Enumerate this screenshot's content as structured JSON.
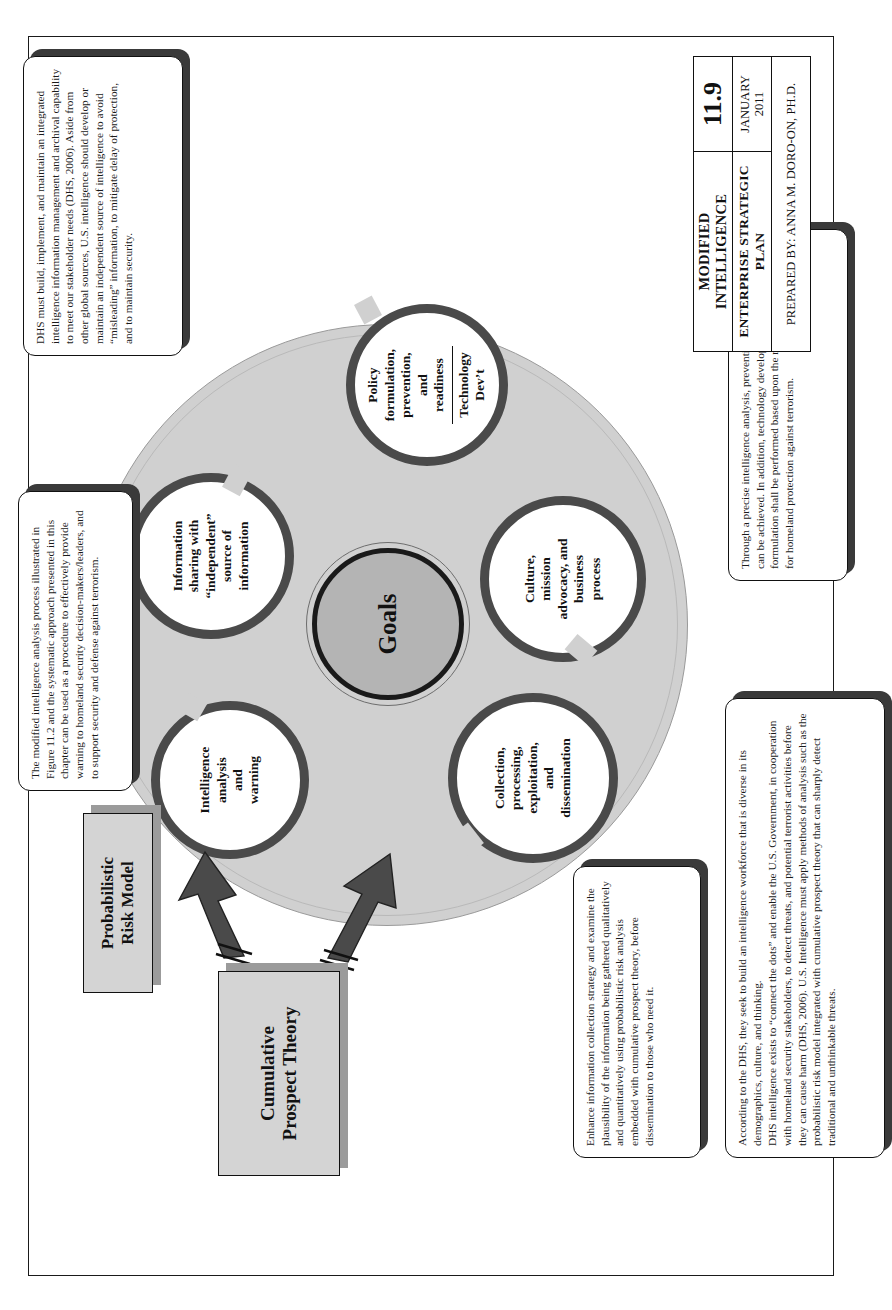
{
  "figure": {
    "labels": {
      "cumulative_prospect_theory": "Cumulative\nProspect Theory",
      "probabilistic_risk_model": "Probabilistic\nRisk Model",
      "center": "Goals"
    },
    "nodes": [
      {
        "id": "intelligence-analysis-and-warning",
        "label": "Intelligence\nanalysis\nand\nwarning"
      },
      {
        "id": "information-sharing",
        "label": "Information\nsharing with\n“independent”\nsource of\ninformation"
      },
      {
        "id": "policy-formulation",
        "label": "Policy\nformulation,\nprevention,\nand\nreadiness",
        "sub": "Technology\nDev’t"
      },
      {
        "id": "culture-mission-advocacy",
        "label": "Culture,\nmission\nadvocacy, and\nbusiness\nprocess"
      },
      {
        "id": "collection-processing",
        "label": "Collection,\nprocessing,\nexploitation,\nand\ndissemination"
      }
    ]
  },
  "callouts": {
    "top_left": "The modified intelligence analysis process illustrated in Figure 11.2 and the systematic approach presented in this chapter can be used as a procedure to effectively provide warning to homeland security decision-makers/leaders, and to support security and defense against terrorism.",
    "top_right": "DHS must build, implement, and maintain an integrated intelligence information management and archival capability to meet our stakeholder needs (DHS, 2006). Aside from other global sources, U.S. intelligence should develop or maintain an independent source of intelligence to avoid “misleading” information, to mitigate delay of protection, and to maintain security.",
    "bottom_left": "Enhance information collection strategy and examine the plausibility of the information being gathered qualitatively and quantitatively using probabilistic risk analysis embedded with cumulative prospect theory, before dissemination to those who need it.",
    "bottom_center_p1": "According to the DHS, they seek to build an intelligence workforce that is diverse in its demographics, culture, and thinking.",
    "bottom_center_p2": "DHS intelligence exists to “connect the dots” and enable the U.S. Government, in cooperation with homeland security stakeholders, to detect threats, and potential terrorist activities before they can cause harm (DHS, 2006). U.S. Intelligence must apply methods of analysis such as the probabilistic risk model integrated with cumulative prospect theory that can sharply detect traditional and unthinkable threats.",
    "bottom_right": "Through a precise intelligence analysis, prevention and preparedness can be achieved. In addition, technology development and policy formulation shall be performed based upon the requirements and needs for homeland protection against terrorism."
  },
  "title_block": {
    "title": "MODIFIED INTELLIGENCE",
    "subtitle": "ENTERPRISE STRATEGIC PLAN",
    "prepared_by": "PREPARED BY: ANNA M. DORO-ON, PH.D.",
    "figure_number": "11.9",
    "date_month": "JANUARY",
    "date_year": "2011"
  }
}
